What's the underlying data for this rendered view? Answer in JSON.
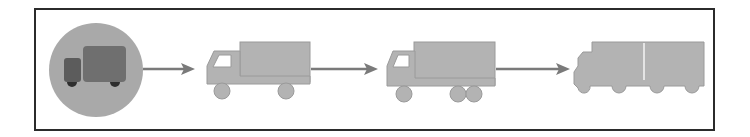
{
  "diagram": {
    "title": "",
    "stages": [
      {
        "id": "stage-1",
        "icon": "delivery-truck-circle-icon",
        "label": ""
      },
      {
        "id": "stage-2",
        "icon": "box-truck-icon",
        "label": ""
      },
      {
        "id": "stage-3",
        "icon": "tandem-axle-truck-icon",
        "label": ""
      },
      {
        "id": "stage-4",
        "icon": "road-train-icon",
        "label": ""
      }
    ],
    "connectors": [
      {
        "from": "stage-1",
        "to": "stage-2",
        "icon": "arrow-right-icon"
      },
      {
        "from": "stage-2",
        "to": "stage-3",
        "icon": "arrow-right-icon"
      },
      {
        "from": "stage-3",
        "to": "stage-4",
        "icon": "arrow-right-icon"
      }
    ],
    "colors": {
      "frame": "#2b2b2b",
      "circle_bg": "#a9a9a9",
      "icon_truck_box": "#6f6f6f",
      "icon_truck_cab": "#5c5c5c",
      "icon_wheels": "#2e2e2e",
      "truck_fill": "#b3b3b3",
      "truck_edge": "#9a9a9a",
      "window": "#ffffff",
      "arrow": "#7a7a7a"
    }
  }
}
